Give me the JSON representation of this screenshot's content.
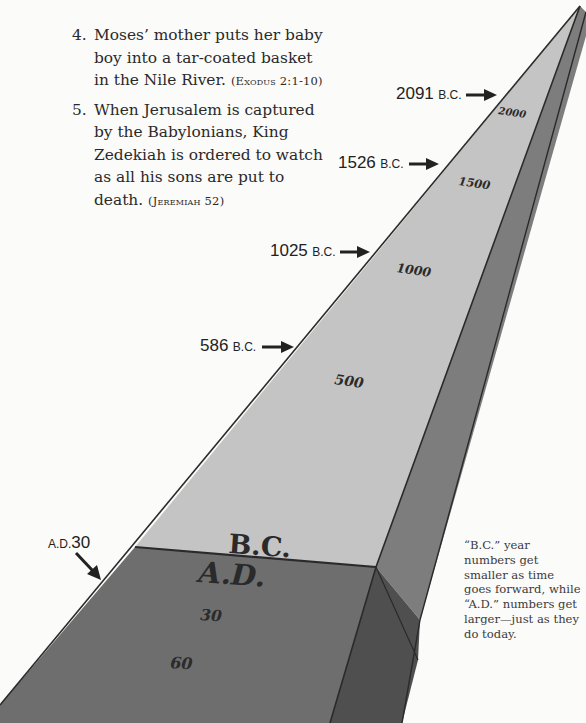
{
  "events": [
    {
      "number": "4.",
      "text": "Moses’ mother puts her baby boy into a tar-coated basket in the Nile River.",
      "reference": "(Exodus 2:1-10)"
    },
    {
      "number": "5.",
      "text": "When Jerusalem is captured by the Babylonians, King Zedekiah is ordered to watch as all his sons are put to death.",
      "reference": "(Jeremiah 52)"
    }
  ],
  "timeline": {
    "callouts": [
      {
        "year": "2091",
        "era": "B.C."
      },
      {
        "year": "1526",
        "era": "B.C."
      },
      {
        "year": "1025",
        "era": "B.C."
      },
      {
        "year": "586",
        "era": "B.C."
      },
      {
        "year": "30",
        "era": "A.D."
      }
    ],
    "ticks": [
      "2000",
      "1500",
      "1000",
      "500",
      "30",
      "60"
    ],
    "era_labels": {
      "bc": "B.C.",
      "ad": "A.D."
    },
    "colors": {
      "bc_surface": "#c4c4c4",
      "bc_side": "#7d7d7d",
      "ad_surface": "#6e6e6e",
      "ad_side": "#4f4f4f",
      "edge": "#2a2a2a"
    }
  },
  "note": "“B.C.” year numbers get smaller as time goes forward, while “A.D.” numbers get larger—just as they do today."
}
